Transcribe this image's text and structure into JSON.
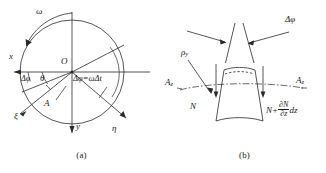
{
  "figure": {
    "title_absent": true,
    "panels": [
      {
        "id": "a",
        "caption": "(a)",
        "labels": {
          "omega": "ω",
          "x_axis": "x",
          "y_axis": "y",
          "origin": "O",
          "theta": "θ",
          "delta_phi_small": "Δφ",
          "point_A": "A",
          "xi_axis": "ξ",
          "eta_axis": "η",
          "delta_phi_eq": "Δφ=ωΔt"
        }
      },
      {
        "id": "b",
        "caption": "(b)",
        "labels": {
          "delta_phi": "Δφ",
          "rho_y": "ρ",
          "rho_y_sub": "y",
          "A_z_left": "A",
          "A_z_left_sub": "z",
          "A_z_right": "A",
          "A_z_right_sub": "z",
          "N_left": "N",
          "N_right_prefix": "N+",
          "N_right_num": "∂N",
          "N_right_den": "∂z",
          "N_right_suffix": "dz"
        }
      }
    ]
  },
  "colors": {
    "stroke": "#2a2a2a",
    "background": "#ffffff",
    "text": "#1a1a1a"
  }
}
